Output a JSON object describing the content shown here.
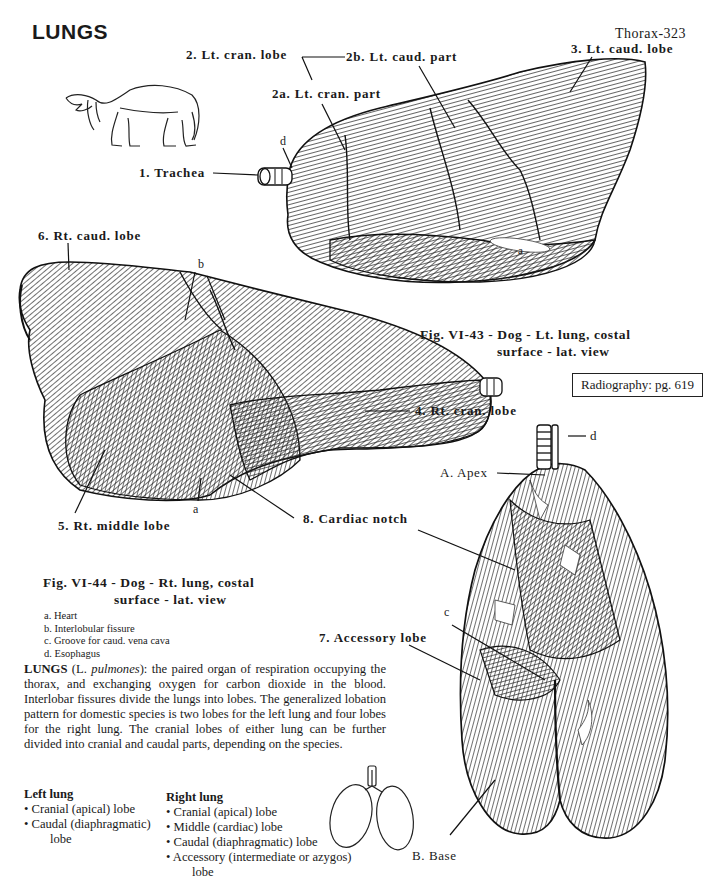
{
  "page": {
    "title": "LUNGS",
    "page_number": "Thorax-323"
  },
  "figure_43": {
    "caption_line1": "Fig. VI-43 - Dog - Lt. lung, costal",
    "caption_line2": "surface - lat. view",
    "labels": {
      "trachea": "1. Trachea",
      "lt_cran_lobe": "2. Lt. cran. lobe",
      "lt_cran_part": "2a. Lt. cran. part",
      "lt_caud_part": "2b. Lt. caud. part",
      "lt_caud_lobe": "3. Lt. caud. lobe",
      "d": "d",
      "a": "a"
    }
  },
  "figure_44": {
    "caption_line1": "Fig. VI-44 - Dog - Rt. lung, costal",
    "caption_line2": "surface - lat. view",
    "labels": {
      "rt_caud_lobe": "6. Rt. caud. lobe",
      "b": "b",
      "rt_cran_lobe": "4. Rt. cran. lobe",
      "rt_middle_lobe": "5. Rt. middle lobe",
      "a": "a",
      "cardiac_notch": "8. Cardiac notch"
    },
    "legend": [
      "a. Heart",
      "b. Interlobular fissure",
      "c. Groove for caud. vena cava",
      "d. Esophagus"
    ]
  },
  "ventral_view": {
    "labels": {
      "d": "d",
      "apex": "A. Apex",
      "c": "c",
      "accessory_lobe": "7. Accessory lobe",
      "base": "B. Base"
    }
  },
  "radiography_ref": "Radiography: pg. 619",
  "description": {
    "term": "LUNGS",
    "latin_prefix": " (L. ",
    "latin": "pulmones",
    "text": "): the paired organ of respiration occupying the thorax, and exchanging oxygen for carbon dioxide in the blood. Interlobar fissures divide the lungs into lobes. The generalized lobation pattern for domestic species is two lobes for the left lung and four lobes for the right lung. The cranial lobes of either lung can be further divided into cranial and caudal parts, depending on the species."
  },
  "left_lung": {
    "heading": "Left lung",
    "items": [
      "• Cranial (apical) lobe",
      "• Caudal (diaphragmatic)",
      "lobe"
    ]
  },
  "right_lung": {
    "heading": "Right lung",
    "items": [
      "• Cranial (apical) lobe",
      "• Middle (cardiac) lobe",
      "• Caudal (diaphragmatic) lobe",
      "• Accessory (intermediate or azygos)",
      "lobe"
    ]
  }
}
